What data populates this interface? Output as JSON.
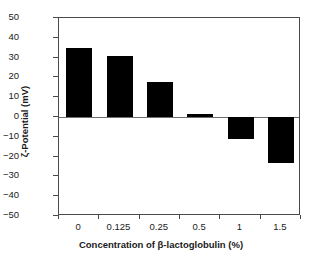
{
  "chart_data": {
    "type": "bar",
    "title": "",
    "categories": [
      "0",
      "0.125",
      "0.25",
      "0.5",
      "1",
      "1.5"
    ],
    "values": [
      35,
      31,
      17.5,
      1.5,
      -11,
      -23
    ],
    "series": [
      {
        "name": "zeta-potential",
        "values": [
          35,
          31,
          17.5,
          1.5,
          -11,
          -23
        ]
      }
    ],
    "xlabel": "Concentration of β-lactoglobulin (%)",
    "ylabel": "ζ-Potential (mV)",
    "ylim": [
      -50,
      50
    ],
    "ytick_labels": [
      "50",
      "40",
      "30",
      "20",
      "10",
      "0",
      "−10",
      "−20",
      "−30",
      "−40",
      "−50"
    ],
    "ytick_values": [
      50,
      40,
      30,
      20,
      10,
      0,
      -10,
      -20,
      -30,
      -40,
      -50
    ],
    "grid": false,
    "legend": false,
    "bar_color": "#000000",
    "axis_color": "#4a4a4a",
    "zero_line_color": "#6e6e6e",
    "background_color": "#ffffff"
  }
}
